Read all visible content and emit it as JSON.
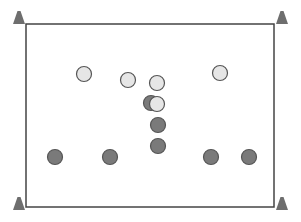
{
  "diagram": {
    "type": "sports-drill-setup",
    "canvas": {
      "width": 301,
      "height": 222,
      "background": "#ffffff"
    },
    "field": {
      "x": 26,
      "y": 24,
      "width": 248,
      "height": 183,
      "stroke": "#444444",
      "stroke_width": 1.5
    },
    "colors": {
      "light_fill": "#e6e6e6",
      "dark_fill": "#7a7a7a",
      "player_stroke": "#555555",
      "cone": "#6e6e6e"
    },
    "cones": [
      {
        "id": "cone-top-left",
        "x": 19,
        "y": 11
      },
      {
        "id": "cone-top-right",
        "x": 282,
        "y": 11
      },
      {
        "id": "cone-bottom-left",
        "x": 19,
        "y": 197
      },
      {
        "id": "cone-bottom-right",
        "x": 282,
        "y": 197
      }
    ],
    "light_players": [
      {
        "id": "light-1",
        "x": 84,
        "y": 74
      },
      {
        "id": "light-2",
        "x": 128,
        "y": 80
      },
      {
        "id": "light-3",
        "x": 157,
        "y": 83
      },
      {
        "id": "light-4",
        "x": 220,
        "y": 73
      }
    ],
    "overlap_player": {
      "dark": {
        "x": 151,
        "y": 103
      },
      "light": {
        "x": 157,
        "y": 104
      }
    },
    "dark_players": [
      {
        "id": "dark-1",
        "x": 158,
        "y": 125
      },
      {
        "id": "dark-2",
        "x": 158,
        "y": 146
      },
      {
        "id": "dark-3",
        "x": 55,
        "y": 157
      },
      {
        "id": "dark-4",
        "x": 110,
        "y": 157
      },
      {
        "id": "dark-5",
        "x": 211,
        "y": 157
      },
      {
        "id": "dark-6",
        "x": 249,
        "y": 157
      }
    ],
    "player_radius": 7.5
  }
}
